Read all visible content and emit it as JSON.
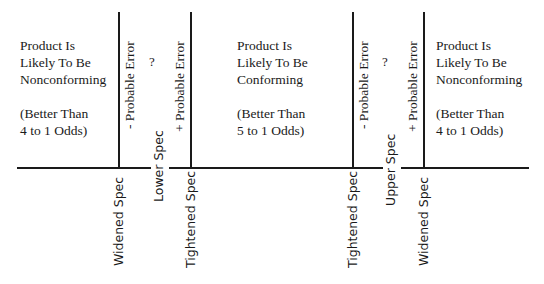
{
  "diagram": {
    "regions": {
      "left": {
        "lines": [
          "Product Is",
          "Likely To Be",
          "Nonconforming"
        ],
        "odds": [
          "(Better  Than",
          "4 to 1 Odds)"
        ]
      },
      "middle": {
        "lines": [
          "Product Is",
          "Likely To Be",
          "Conforming"
        ],
        "odds": [
          "(Better  Than",
          "5 to 1 Odds)"
        ]
      },
      "right": {
        "lines": [
          "Product Is",
          "Likely To Be",
          "Nonconforming"
        ],
        "odds": [
          "(Better  Than",
          "4 to 1 Odds)"
        ]
      }
    },
    "error_labels": {
      "lower_minus": "- Probable Error",
      "lower_plus": "+ Probable Error",
      "upper_minus": "- Probable Error",
      "upper_plus": "+ Probable Error"
    },
    "uncertain_marks": {
      "lower": "?",
      "upper": "?"
    },
    "axis_labels": {
      "lower_widened": "Widened  Spec",
      "lower_spec": "Lower Spec",
      "lower_tightened": "Tightened Spec",
      "upper_tightened": "Tightened Spec",
      "upper_spec": "Upper Spec",
      "upper_widened": "Widened  Spec"
    },
    "colors": {
      "ink": "#1a1a1a",
      "background": "#ffffff"
    }
  }
}
